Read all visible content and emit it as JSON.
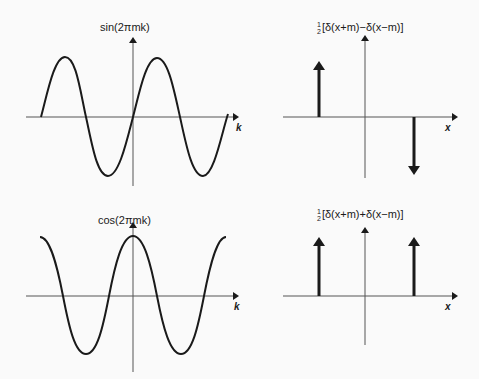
{
  "panels": [
    {
      "id": "sin",
      "label": "sin(2πmk)",
      "xaxis": "k"
    },
    {
      "id": "odd-delta",
      "label_frac": "1/2",
      "label_num": "1",
      "label_den": "2",
      "label": "[δ(x+m)−δ(x−m)]",
      "xaxis": "x"
    },
    {
      "id": "cos",
      "label": "cos(2πmk)",
      "xaxis": "k"
    },
    {
      "id": "even-delta",
      "label_frac": "1/2",
      "label_num": "1",
      "label_den": "2",
      "label": "[δ(x+m)+δ(x−m)]",
      "xaxis": "x"
    }
  ],
  "colors": {
    "ink": "#1a1a1a",
    "axis": "#555555",
    "background": "#fafafa"
  }
}
